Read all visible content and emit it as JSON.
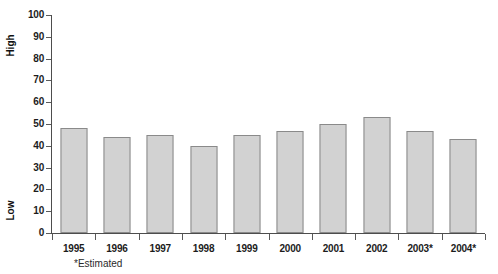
{
  "chart_data": {
    "type": "bar",
    "title": "",
    "subtitle": "",
    "xlabel": "",
    "ylabel": "",
    "categories": [
      "1995",
      "1996",
      "1997",
      "1998",
      "1999",
      "2000",
      "2001",
      "2002",
      "2003*",
      "2004*"
    ],
    "values": [
      48,
      44,
      45,
      40,
      45,
      47,
      50,
      53,
      47,
      43
    ],
    "ylim": [
      0,
      100
    ],
    "ytick_values": [
      0,
      10,
      20,
      30,
      40,
      50,
      60,
      70,
      80,
      90,
      100
    ],
    "ytick_labels": [
      "0",
      "10",
      "20",
      "30",
      "40",
      "50",
      "60",
      "70",
      "80",
      "90",
      "100"
    ],
    "grid": false,
    "legend": false,
    "legend_position": "none",
    "annotations": {
      "axis_top_caption": "High",
      "axis_bottom_caption": "Low",
      "footnote": "*Estimated"
    },
    "colors": {
      "bar_fill": "#d2d2d2",
      "bar_border": "#8a8a8a",
      "axis": "#4d4d4d",
      "text": "#1c1c1c",
      "background": "#ffffff"
    }
  }
}
